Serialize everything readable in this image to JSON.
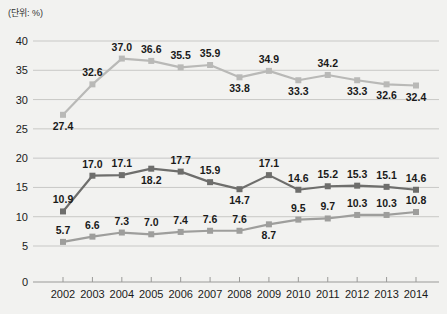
{
  "unit_label": "(단위: %)",
  "chart_data": {
    "type": "line",
    "title": "",
    "subtitle": "",
    "xlabel": "",
    "ylabel": "",
    "unit": "%",
    "grid": true,
    "legend_position": "none",
    "ylim": [
      0,
      40
    ],
    "yticks": [
      0,
      5,
      10,
      15,
      20,
      25,
      30,
      35,
      40
    ],
    "categories": [
      "2002",
      "2003",
      "2004",
      "2005",
      "2006",
      "2007",
      "2008",
      "2009",
      "2010",
      "2011",
      "2012",
      "2013",
      "2014"
    ],
    "series": [
      {
        "name": "series-top",
        "color": "#b9b9b7",
        "marker": "square",
        "values": [
          27.4,
          32.6,
          37.0,
          36.6,
          35.5,
          35.9,
          33.8,
          34.9,
          33.3,
          34.2,
          33.3,
          32.6,
          32.4
        ],
        "label_positions": [
          "below",
          "above",
          "above",
          "above",
          "above",
          "above",
          "below",
          "above",
          "below",
          "above",
          "below",
          "below",
          "below"
        ]
      },
      {
        "name": "series-middle",
        "color": "#6e6e6c",
        "marker": "square",
        "values": [
          10.9,
          17.0,
          17.1,
          18.2,
          17.7,
          15.9,
          14.7,
          17.1,
          14.6,
          15.2,
          15.3,
          15.1,
          14.6
        ],
        "label_positions": [
          "above",
          "above",
          "above",
          "below",
          "above",
          "above",
          "below",
          "above",
          "above",
          "above",
          "above",
          "above",
          "above"
        ]
      },
      {
        "name": "series-bottom",
        "color": "#9e9e9c",
        "marker": "square",
        "values": [
          5.7,
          6.6,
          7.3,
          7.0,
          7.4,
          7.6,
          7.6,
          8.7,
          9.5,
          9.7,
          10.3,
          10.3,
          10.8
        ],
        "label_positions": [
          "above",
          "above",
          "above",
          "above",
          "above",
          "above",
          "above",
          "below",
          "above",
          "above",
          "above",
          "above",
          "above"
        ]
      }
    ]
  }
}
